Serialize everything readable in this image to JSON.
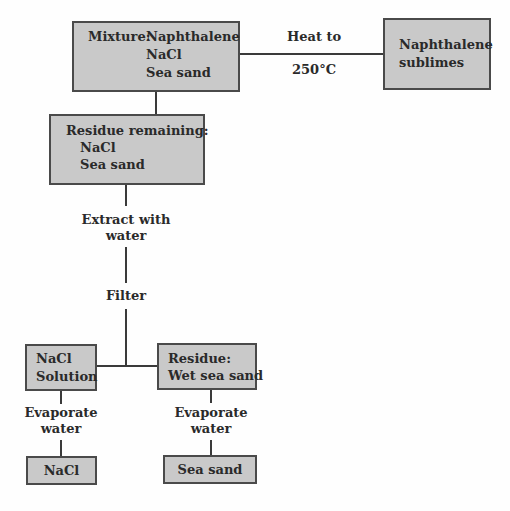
{
  "diagram": {
    "nodes": {
      "mixture": {
        "label": "Mixture:",
        "items": [
          "Naphthalene",
          "NaCl",
          "Sea sand"
        ]
      },
      "sublimed": {
        "line1": "Naphthalene",
        "line2": "sublimes"
      },
      "residue_remaining": {
        "label": "Residue remaining:",
        "items": [
          "NaCl",
          "Sea sand"
        ]
      },
      "nacl_solution": {
        "line1": "NaCl",
        "line2": "Solution"
      },
      "wet_residue": {
        "line1": "Residue:",
        "line2": "Wet sea sand"
      },
      "nacl_final": {
        "label": "NaCl"
      },
      "sand_final": {
        "label": "Sea sand"
      }
    },
    "steps": {
      "heat": {
        "line1": "Heat to",
        "line2": "250°C"
      },
      "extract": {
        "line1": "Extract with",
        "line2": "water"
      },
      "filter": {
        "label": "Filter"
      },
      "evaporate_left": {
        "line1": "Evaporate",
        "line2": "water"
      },
      "evaporate_right": {
        "line1": "Evaporate",
        "line2": "water"
      }
    },
    "colors": {
      "box_fill": "#c9c9c9",
      "box_border": "#4a4a4a",
      "line": "#3a3a3a",
      "text": "#2a2a2a"
    }
  }
}
